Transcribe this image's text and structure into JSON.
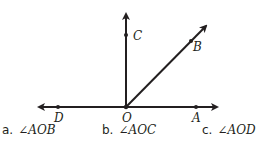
{
  "figure": {
    "points": {
      "O": "O",
      "A": "A",
      "B": "B",
      "C": "C",
      "D": "D"
    },
    "stroke_color": "#231f20"
  },
  "questions": [
    {
      "letter": "a.",
      "angle": "∠AOB"
    },
    {
      "letter": "b.",
      "angle": "∠AOC"
    },
    {
      "letter": "c.",
      "angle": "∠AOD"
    }
  ]
}
